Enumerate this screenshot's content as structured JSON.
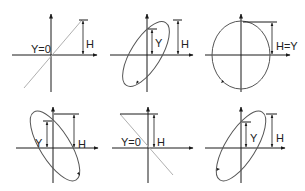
{
  "figure": {
    "colors": {
      "axis": "#1a1a1a",
      "curve": "#555555",
      "line_gray": "#b0b0b0",
      "background": "#ffffff"
    },
    "panels": [
      {
        "id": "top-left",
        "shape": "line",
        "slope": "positive",
        "labels": {
          "y": "Y=0",
          "h": "H"
        }
      },
      {
        "id": "top-center",
        "shape": "ellipse",
        "tilt": "positive",
        "labels": {
          "y": "Y",
          "h": "H"
        }
      },
      {
        "id": "top-right",
        "shape": "circle",
        "labels": {
          "h": "H=Y"
        }
      },
      {
        "id": "bottom-left",
        "shape": "ellipse",
        "tilt": "negative",
        "labels": {
          "y": "Y",
          "h": "H"
        }
      },
      {
        "id": "bottom-center",
        "shape": "line",
        "slope": "negative",
        "labels": {
          "y": "Y=0",
          "h": "H"
        }
      },
      {
        "id": "bottom-right",
        "shape": "ellipse",
        "tilt": "positive",
        "labels": {
          "y": "Y",
          "h": "H"
        }
      }
    ]
  }
}
